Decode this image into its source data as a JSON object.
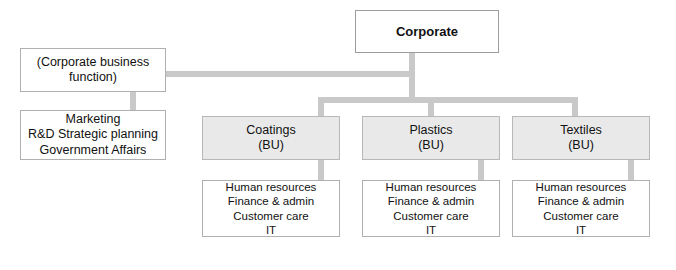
{
  "diagram": {
    "colors": {
      "connector": "#c9c9c9",
      "bu_fill": "#e9e9e9",
      "box_border": "#b0b0b0",
      "background": "#ffffff",
      "text": "#111111"
    },
    "corporate": {
      "label": "Corporate"
    },
    "corporate_business_function": {
      "lines": [
        "(Corporate business",
        "function)"
      ]
    },
    "corporate_functions": {
      "lines": [
        "Marketing",
        "R&D Strategic planning",
        "Government Affairs"
      ]
    },
    "business_units": [
      {
        "name": "Coatings",
        "type": "(BU)",
        "functions": [
          "Human resources",
          "Finance & admin",
          "Customer care",
          "IT"
        ]
      },
      {
        "name": "Plastics",
        "type": "(BU)",
        "functions": [
          "Human resources",
          "Finance & admin",
          "Customer care",
          "IT"
        ]
      },
      {
        "name": "Textiles",
        "type": "(BU)",
        "functions": [
          "Human resources",
          "Finance & admin",
          "Customer care",
          "IT"
        ]
      }
    ]
  }
}
